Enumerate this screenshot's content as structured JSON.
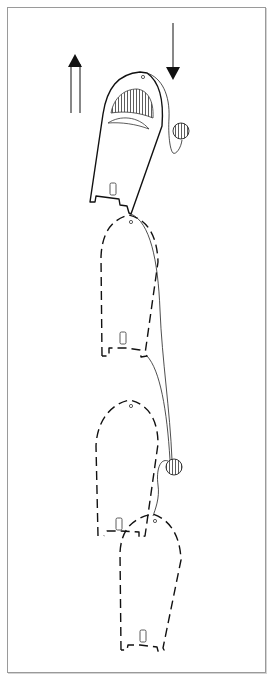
{
  "diagram": {
    "title": "",
    "arrows": [
      {
        "name": "upward-arrow",
        "direction": "up",
        "style": "double-shaft"
      },
      {
        "name": "downward-arrow",
        "direction": "down",
        "style": "single-shaft"
      }
    ],
    "boats": [
      {
        "name": "boat-position-1",
        "style": "solid",
        "state": "current"
      },
      {
        "name": "boat-position-2",
        "style": "dashed",
        "state": "ghost"
      },
      {
        "name": "boat-position-3",
        "style": "dashed",
        "state": "ghost"
      },
      {
        "name": "boat-position-4",
        "style": "dashed",
        "state": "ghost"
      }
    ],
    "buoys": [
      {
        "name": "buoy-upper",
        "fill": "hatched"
      },
      {
        "name": "buoy-lower",
        "fill": "hatched"
      }
    ],
    "colors": {
      "ink": "#111111",
      "background": "#ffffff",
      "frame": "#9a9a9a"
    }
  }
}
